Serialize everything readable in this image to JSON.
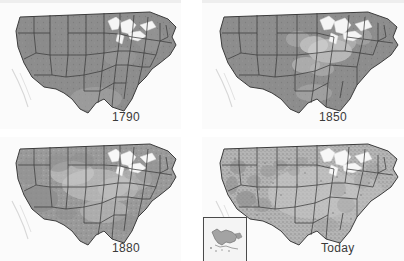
{
  "figure": {
    "kind": "map-series",
    "layout": "2x2 grid of grayscale contiguous-US maps",
    "rows": 2,
    "columns": 2,
    "background_color": "#ffffff",
    "top_strip_color": "#eeeeee"
  },
  "palette": {
    "forest_dark": "#8f8f8f",
    "forest_mid": "#a0a0a0",
    "cleared_light": "#c9c9c9",
    "cleared_lighter": "#dcdcdc",
    "ocean": "#fbfbfb",
    "lakes": "#f4f4f4",
    "border_line": "#3c3c3c",
    "label_text": "#3a3a3a",
    "inset_border": "#4a4a4a"
  },
  "panels": [
    {
      "id": "panel-1790",
      "label": "1790",
      "position": "top-left",
      "label_position": "bottom-center-right",
      "has_inset": false,
      "description": "Nearly continuous dark forest cover across the eastern and western United States; Great Lakes shown light."
    },
    {
      "id": "panel-1850",
      "label": "1850",
      "position": "top-right",
      "label_position": "bottom-center-right",
      "has_inset": false,
      "description": "Light cleared patches appear through the Ohio Valley, lower Great Lakes and central plains."
    },
    {
      "id": "panel-1880",
      "label": "1880",
      "position": "bottom-left",
      "label_position": "bottom-center-right",
      "has_inset": false,
      "description": "Forest becomes fragmented; broad light areas across the Midwest, Great Plains and interior West."
    },
    {
      "id": "panel-today",
      "label": "Today",
      "position": "bottom-right",
      "label_position": "bottom-right",
      "has_inset": true,
      "inset": {
        "name": "alaska-inset",
        "position": "bottom-left",
        "description": "Small bordered box containing the outline of Alaska"
      },
      "description": "Heavily fragmented, mottled and speckled forest remnants; dense clearing across the East and scattered stands in the West."
    }
  ],
  "state_outlines": {
    "visible": true,
    "style": "thin dark gray boundary lines over all panels"
  }
}
